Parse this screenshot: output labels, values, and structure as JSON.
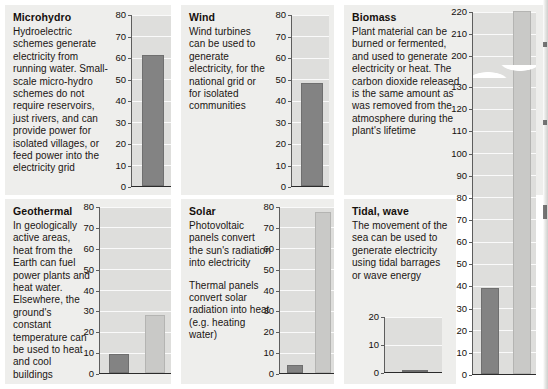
{
  "figure": {
    "panel_bg": "#eeeeec",
    "plot_bg": "#dededc",
    "bar_dark": "#838383",
    "bar_light": "#c9c9c7"
  },
  "panels": [
    {
      "id": "microhydro",
      "title": "Microhydro",
      "paragraphs": [
        "Hydroelectric schemes generate electricity from running water. Small-scale micro-hydro schemes do not require reservoirs, just rivers, and can provide power for isolated villages, or feed power into the electricity grid"
      ],
      "chart": {
        "type": "bar",
        "categories": [
          "electricity"
        ],
        "values": [
          61
        ],
        "bar_styles": [
          "dark"
        ],
        "ylim": [
          0,
          80
        ],
        "yticks": [
          0,
          10,
          20,
          30,
          40,
          50,
          60,
          70,
          80
        ],
        "ylabel": "",
        "xlabel": "",
        "grid": true,
        "axis_break": false
      }
    },
    {
      "id": "wind",
      "title": "Wind",
      "paragraphs": [
        "Wind turbines can be used to generate electricity, for the national grid or for isolated communities"
      ],
      "chart": {
        "type": "bar",
        "categories": [
          "electricity"
        ],
        "values": [
          48
        ],
        "bar_styles": [
          "dark"
        ],
        "ylim": [
          0,
          80
        ],
        "yticks": [
          0,
          10,
          20,
          30,
          40,
          50,
          60,
          70,
          80
        ],
        "ylabel": "",
        "xlabel": "",
        "grid": true,
        "axis_break": false
      }
    },
    {
      "id": "biomass",
      "title": "Biomass",
      "paragraphs": [
        "Plant material can be burned or fermented, and used to generate electricity or heat. The carbon dioxide released is the same amount as was removed from the atmosphere during the plant's lifetime"
      ],
      "chart": {
        "type": "bar",
        "categories": [
          "electricity",
          "heat"
        ],
        "values": [
          39,
          220
        ],
        "bar_styles": [
          "dark",
          "light"
        ],
        "ylim": [
          0,
          220
        ],
        "yticks": [
          0,
          10,
          20,
          30,
          40,
          50,
          60,
          70,
          80,
          90,
          100,
          110,
          120,
          130,
          200,
          210,
          220
        ],
        "ylabel": "",
        "xlabel": "",
        "grid": true,
        "axis_break": true,
        "break_between": [
          130,
          200
        ]
      }
    },
    {
      "id": "geothermal",
      "title": "Geothermal",
      "paragraphs": [
        "In geologically active areas, heat from the Earth can fuel power plants and heat water. Elsewhere, the ground's constant temperature can be used to heat and cool buildings"
      ],
      "chart": {
        "type": "bar",
        "categories": [
          "electricity",
          "heat"
        ],
        "values": [
          9,
          28
        ],
        "bar_styles": [
          "dark",
          "light"
        ],
        "ylim": [
          0,
          80
        ],
        "yticks": [
          0,
          10,
          20,
          30,
          40,
          50,
          60,
          70,
          80
        ],
        "ylabel": "",
        "xlabel": "",
        "grid": true,
        "axis_break": false
      }
    },
    {
      "id": "solar",
      "title": "Solar",
      "paragraphs": [
        "Photovoltaic panels convert the sun's radiation into electricity",
        "Thermal panels convert solar radiation into heat (e.g. heating water)"
      ],
      "chart": {
        "type": "bar",
        "categories": [
          "electricity",
          "heat"
        ],
        "values": [
          4,
          77
        ],
        "bar_styles": [
          "dark",
          "light"
        ],
        "ylim": [
          0,
          80
        ],
        "yticks": [
          0,
          10,
          20,
          30,
          40,
          50,
          60,
          70,
          80
        ],
        "ylabel": "",
        "xlabel": "",
        "grid": true,
        "axis_break": false
      }
    },
    {
      "id": "tidal-wave",
      "title": "Tidal, wave",
      "paragraphs": [
        "The movement of the sea can be used to generate electricity using tidal barrages or wave energy"
      ],
      "chart": {
        "type": "bar",
        "categories": [
          "electricity"
        ],
        "values": [
          0.6
        ],
        "bar_styles": [
          "dark"
        ],
        "ylim": [
          0,
          20
        ],
        "yticks": [
          0,
          10,
          20
        ],
        "ylabel": "",
        "xlabel": "",
        "grid": true,
        "axis_break": false
      }
    }
  ]
}
